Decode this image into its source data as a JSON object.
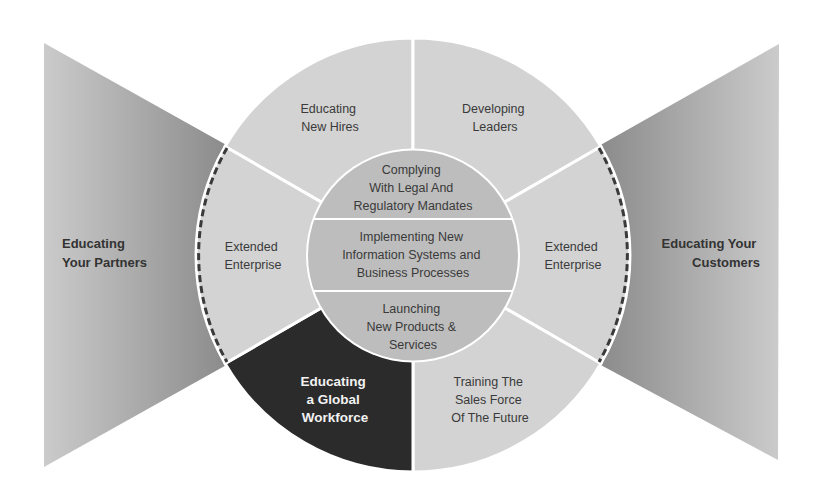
{
  "diagram": {
    "colors": {
      "background": "#ffffff",
      "outer_segment": "#d3d3d3",
      "highlight_segment": "#2b2b2b",
      "inner_circle": "#bdbdbd",
      "divider": "#ffffff",
      "dashed_border": "#3a3a3a",
      "wedge_light": "#cbcbcb",
      "wedge_dark": "#8c8c8c"
    },
    "side_wedges": {
      "left": {
        "lines": [
          "Educating",
          "Your Partners"
        ]
      },
      "right": {
        "lines": [
          "Educating Your",
          "Customers"
        ]
      }
    },
    "outer_segments": [
      {
        "id": "top-left",
        "lines": [
          "Educating",
          "New Hires"
        ],
        "highlighted": false
      },
      {
        "id": "top-right",
        "lines": [
          "Developing",
          "Leaders"
        ],
        "highlighted": false
      },
      {
        "id": "right",
        "lines": [
          "Extended",
          "Enterprise"
        ],
        "highlighted": false
      },
      {
        "id": "bottom-right",
        "lines": [
          "Training The",
          "Sales Force",
          "Of The Future"
        ],
        "highlighted": false
      },
      {
        "id": "bottom-left",
        "lines": [
          "Educating",
          "a Global",
          "Workforce"
        ],
        "highlighted": true
      },
      {
        "id": "left",
        "lines": [
          "Extended",
          "Enterprise"
        ],
        "highlighted": false
      }
    ],
    "inner_bands": [
      {
        "lines": [
          "Complying",
          "With Legal And",
          "Regulatory Mandates"
        ]
      },
      {
        "lines": [
          "Implementing New",
          "Information Systems and",
          "Business Processes"
        ]
      },
      {
        "lines": [
          "Launching",
          "New Products &",
          "Services"
        ]
      }
    ]
  }
}
